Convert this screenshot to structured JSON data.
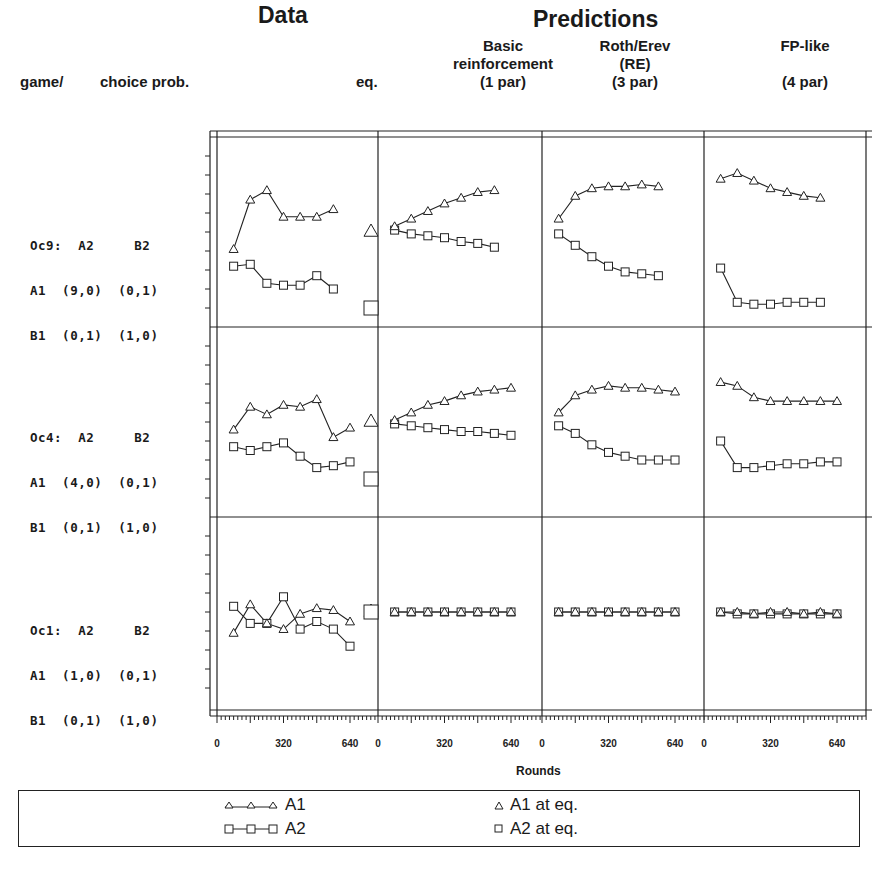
{
  "headers": {
    "data_title": "Data",
    "predictions_title": "Predictions",
    "game_label": "game/",
    "choice_label": "choice prob.",
    "eq_label": "eq.",
    "models": [
      {
        "line1": "Basic",
        "line2": "reinforcement",
        "line3": "(1 par)"
      },
      {
        "line1": "Roth/Erev",
        "line2": "(RE)",
        "line3": "(3 par)"
      },
      {
        "line1": "FP-like",
        "line2": "",
        "line3": "(4 par)"
      }
    ]
  },
  "games": [
    {
      "l1": "Oc9:  A2     B2",
      "l2": "A1  (9,0)  (0,1)",
      "l3": "B1  (0,1)  (1,0)"
    },
    {
      "l1": "Oc4:  A2     B2",
      "l2": "A1  (4,0)  (0,1)",
      "l3": "B1  (0,1)  (1,0)"
    },
    {
      "l1": "Oc1:  A2     B2",
      "l2": "A1  (1,0)  (0,1)",
      "l3": "B1  (0,1)  (1,0)"
    }
  ],
  "xaxis": {
    "label": "Rounds",
    "ticks": [
      "0",
      "320",
      "640"
    ]
  },
  "legend": {
    "a1": "A1",
    "a2": "A2",
    "a1_eq": "A1 at eq.",
    "a2_eq": "A2 at eq."
  },
  "chart_data": {
    "type": "line",
    "xlabel": "Rounds",
    "ylabel": "choice prob.",
    "xlim": [
      0,
      700
    ],
    "ylim": [
      0,
      1
    ],
    "grid": false,
    "legend_position": "bottom",
    "columns": [
      "Data",
      "Basic reinforcement (1 par)",
      "Roth/Erev (RE) (3 par)",
      "FP-like (4 par)"
    ],
    "rows": [
      {
        "game": "Oc9",
        "eq": {
          "A1": 0.5,
          "A2": 0.1
        },
        "panels": [
          {
            "x": [
              80,
              160,
              240,
              320,
              400,
              480,
              560
            ],
            "A1": [
              0.41,
              0.67,
              0.72,
              0.58,
              0.58,
              0.58,
              0.62
            ],
            "A2": [
              0.32,
              0.33,
              0.23,
              0.22,
              0.22,
              0.27,
              0.2
            ]
          },
          {
            "x": [
              80,
              160,
              240,
              320,
              400,
              480,
              560
            ],
            "A1": [
              0.53,
              0.57,
              0.61,
              0.65,
              0.68,
              0.71,
              0.72
            ],
            "A2": [
              0.51,
              0.49,
              0.48,
              0.47,
              0.45,
              0.44,
              0.42
            ]
          },
          {
            "x": [
              80,
              160,
              240,
              320,
              400,
              480,
              560
            ],
            "A1": [
              0.57,
              0.69,
              0.73,
              0.74,
              0.74,
              0.75,
              0.74
            ],
            "A2": [
              0.49,
              0.43,
              0.37,
              0.32,
              0.29,
              0.28,
              0.27
            ]
          },
          {
            "x": [
              80,
              160,
              240,
              320,
              400,
              480,
              560
            ],
            "A1": [
              0.78,
              0.81,
              0.77,
              0.73,
              0.71,
              0.69,
              0.68
            ],
            "A2": [
              0.31,
              0.13,
              0.12,
              0.12,
              0.13,
              0.13,
              0.13
            ]
          }
        ]
      },
      {
        "game": "Oc4",
        "eq": {
          "A1": 0.5,
          "A2": 0.2
        },
        "panels": [
          {
            "x": [
              80,
              160,
              240,
              320,
              400,
              480,
              560,
              640
            ],
            "A1": [
              0.46,
              0.58,
              0.54,
              0.59,
              0.58,
              0.62,
              0.42,
              0.47
            ],
            "A2": [
              0.37,
              0.35,
              0.37,
              0.39,
              0.32,
              0.26,
              0.27,
              0.29
            ]
          },
          {
            "x": [
              80,
              160,
              240,
              320,
              400,
              480,
              560,
              640
            ],
            "A1": [
              0.51,
              0.55,
              0.59,
              0.61,
              0.64,
              0.66,
              0.67,
              0.68
            ],
            "A2": [
              0.49,
              0.48,
              0.47,
              0.46,
              0.45,
              0.45,
              0.44,
              0.43
            ]
          },
          {
            "x": [
              80,
              160,
              240,
              320,
              400,
              480,
              560,
              640
            ],
            "A1": [
              0.55,
              0.64,
              0.67,
              0.69,
              0.68,
              0.68,
              0.67,
              0.66
            ],
            "A2": [
              0.48,
              0.44,
              0.38,
              0.34,
              0.32,
              0.3,
              0.3,
              0.3
            ]
          },
          {
            "x": [
              80,
              160,
              240,
              320,
              400,
              480,
              560,
              640
            ],
            "A1": [
              0.71,
              0.69,
              0.63,
              0.61,
              0.61,
              0.61,
              0.61,
              0.61
            ],
            "A2": [
              0.4,
              0.26,
              0.26,
              0.27,
              0.28,
              0.28,
              0.29,
              0.29
            ]
          }
        ]
      },
      {
        "game": "Oc1",
        "eq": {
          "A1": 0.5,
          "A2": 0.5
        },
        "panels": [
          {
            "x": [
              80,
              160,
              240,
              320,
              400,
              480,
              560,
              640
            ],
            "A1": [
              0.39,
              0.54,
              0.44,
              0.41,
              0.49,
              0.52,
              0.51,
              0.45
            ],
            "A2": [
              0.53,
              0.44,
              0.44,
              0.58,
              0.41,
              0.45,
              0.41,
              0.32
            ]
          },
          {
            "x": [
              80,
              160,
              240,
              320,
              400,
              480,
              560,
              640
            ],
            "A1": [
              0.5,
              0.5,
              0.5,
              0.5,
              0.5,
              0.5,
              0.5,
              0.5
            ],
            "A2": [
              0.5,
              0.5,
              0.5,
              0.5,
              0.5,
              0.5,
              0.5,
              0.5
            ]
          },
          {
            "x": [
              80,
              160,
              240,
              320,
              400,
              480,
              560,
              640
            ],
            "A1": [
              0.5,
              0.5,
              0.5,
              0.5,
              0.5,
              0.5,
              0.5,
              0.5
            ],
            "A2": [
              0.5,
              0.5,
              0.5,
              0.5,
              0.5,
              0.5,
              0.5,
              0.5
            ]
          },
          {
            "x": [
              80,
              160,
              240,
              320,
              400,
              480,
              560,
              640
            ],
            "A1": [
              0.5,
              0.5,
              0.49,
              0.5,
              0.5,
              0.49,
              0.5,
              0.49
            ],
            "A2": [
              0.5,
              0.49,
              0.49,
              0.49,
              0.49,
              0.49,
              0.49,
              0.49
            ]
          }
        ]
      }
    ]
  }
}
